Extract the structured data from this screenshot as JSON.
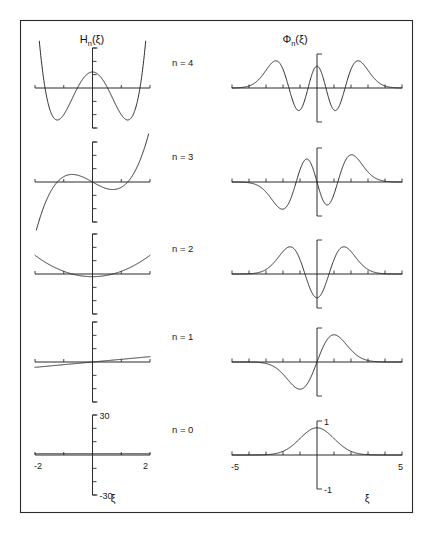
{
  "figure": {
    "columns": [
      {
        "id": "hermite",
        "header_base": "H",
        "header_sub": "n",
        "header_arg": "(ξ)"
      },
      {
        "id": "wavefunction",
        "header_base": "Φ",
        "header_sub": "n",
        "header_arg": "(ξ)"
      }
    ],
    "row_labels": [
      "n = 4",
      "n = 3",
      "n = 2",
      "n = 1",
      "n = 0"
    ],
    "xaxis_label": "ξ",
    "left_axis": {
      "x_min_label": "-2",
      "x_max_label": "2",
      "y_max_label": "30",
      "y_min_label": "-30"
    },
    "right_axis": {
      "x_min_label": "-5",
      "x_max_label": "5",
      "y_max_label": "1",
      "y_min_label": "-1"
    },
    "colors": {
      "curve": "#232323",
      "axis": "#2b2b2b",
      "frame": "#2a2a2a",
      "background": "#ffffff"
    }
  },
  "chart_data": [
    {
      "type": "line",
      "title": "Hermite polynomials H_n(xi)",
      "xlabel": "ξ",
      "ylabel": "H_n(ξ)",
      "xlim": [
        -2,
        2
      ],
      "ylim": [
        -30,
        30
      ],
      "xticks": [
        -2,
        -1,
        0,
        1,
        2
      ],
      "yticks": [
        -30,
        -20,
        -10,
        0,
        10,
        20,
        30
      ],
      "grid": false,
      "legend": "none",
      "series": [
        {
          "name": "n = 4",
          "n": 4,
          "coeffs": [
            12,
            0,
            -48,
            0,
            16
          ]
        },
        {
          "name": "n = 3",
          "n": 3,
          "coeffs": [
            0,
            -12,
            0,
            8
          ]
        },
        {
          "name": "n = 2",
          "n": 2,
          "coeffs": [
            -2,
            0,
            4
          ]
        },
        {
          "name": "n = 1",
          "n": 1,
          "coeffs": [
            0,
            2
          ]
        },
        {
          "name": "n = 0",
          "n": 0,
          "coeffs": [
            1
          ]
        }
      ]
    },
    {
      "type": "line",
      "title": "Harmonic oscillator wavefunctions Phi_n(xi)",
      "xlabel": "ξ",
      "ylabel": "Φ_n(ξ)",
      "xlim": [
        -5,
        5
      ],
      "ylim": [
        -1,
        1
      ],
      "xticks": [
        -5,
        -4,
        -3,
        -2,
        -1,
        0,
        1,
        2,
        3,
        4,
        5
      ],
      "yticks": [
        -1,
        0,
        1
      ],
      "grid": false,
      "legend": "none",
      "series": [
        {
          "name": "n = 4",
          "n": 4,
          "nodes": 4,
          "parity": "even"
        },
        {
          "name": "n = 3",
          "n": 3,
          "nodes": 3,
          "parity": "odd"
        },
        {
          "name": "n = 2",
          "n": 2,
          "nodes": 2,
          "parity": "even"
        },
        {
          "name": "n = 1",
          "n": 1,
          "nodes": 1,
          "parity": "odd"
        },
        {
          "name": "n = 0",
          "n": 0,
          "nodes": 0,
          "parity": "even"
        }
      ]
    }
  ]
}
